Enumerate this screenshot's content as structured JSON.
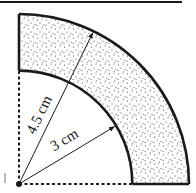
{
  "figure": {
    "type": "annulus-quarter-sector",
    "shape": "quarter ring (shaded region between two quarter circles)",
    "inner_radius": {
      "value": 3,
      "unit": "cm",
      "label": "3 cm"
    },
    "outer_radius": {
      "value": 4.5,
      "unit": "cm",
      "label": "4.5 cm"
    },
    "sector_angle_degrees": 90,
    "shaded_region": "area between inner and outer arcs",
    "colors": {
      "stroke": "#1a1a1a",
      "dots": "#333333",
      "background": "#ffffff"
    }
  }
}
